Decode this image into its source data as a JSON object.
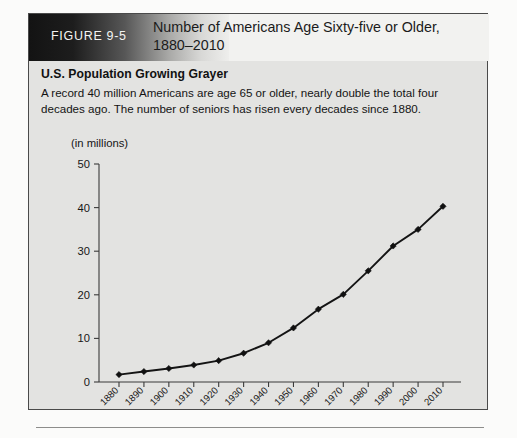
{
  "figure": {
    "number_label": "FIGURE 9-5",
    "title": "Number of Americans Age Sixty-five or Older, 1880–2010"
  },
  "caption": {
    "heading": "U.S. Population Growing Grayer",
    "body": "A record 40 million Americans are age 65 or older, nearly double the total four decades ago. The number of seniors has risen every decades since 1880."
  },
  "chart_data": {
    "type": "line",
    "title": "Number of Americans Age Sixty-five or Older, 1880–2010",
    "xlabel": "",
    "ylabel": "(in millions)",
    "unit_label": "(in millions)",
    "categories": [
      "1880",
      "1890",
      "1900",
      "1910",
      "1920",
      "1930",
      "1940",
      "1950",
      "1960",
      "1970",
      "1980",
      "1990",
      "2000",
      "2010"
    ],
    "values": [
      1.7,
      2.4,
      3.1,
      3.9,
      4.9,
      6.6,
      9.0,
      12.4,
      16.7,
      20.1,
      25.5,
      31.2,
      35.0,
      40.3
    ],
    "ylim": [
      0,
      50
    ],
    "yticks": [
      "0",
      "10",
      "20",
      "30",
      "40",
      "50"
    ],
    "ytick_values": [
      0,
      10,
      20,
      30,
      40,
      50
    ],
    "grid": false,
    "legend": "none",
    "marker": "diamond",
    "line_color": "#141414",
    "marker_color": "#101010"
  },
  "colors": {
    "figure_panel": "#e3e3e1",
    "header_dark": "#131313",
    "header_light": "#eeeeec",
    "border": "#4a4a4a",
    "text": "#141414"
  }
}
